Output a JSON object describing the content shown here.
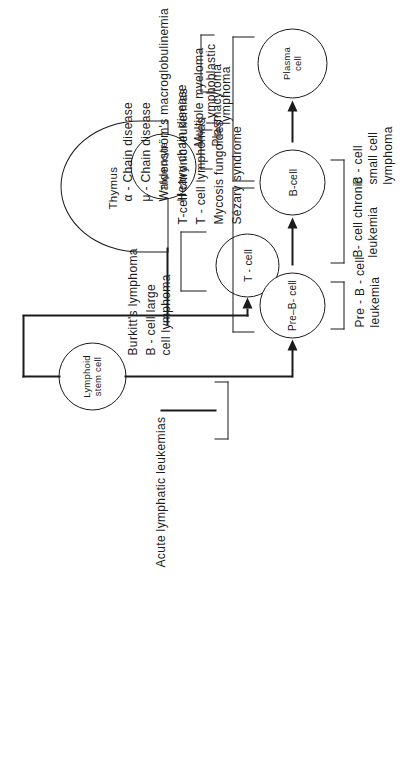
{
  "figure": {
    "orientation": "rotated-90-ccw",
    "line_color": "#1b1b1b",
    "background": "#ffffff"
  },
  "nodes": {
    "stem_cell": "Lymphoid\nstem cell",
    "t_cell": "T - cell",
    "pre_b_cell": "Pre–B- cell",
    "b_cell": "B-cell",
    "plasma_cell": "Plasma\ncell",
    "thymocyte": "Thymocyte",
    "thymus": "Thymus"
  },
  "labels": {
    "acute_lymphatic_leukemias": "Acute  lymphatic  leukemias",
    "lymphoblastic_lymphoma": "Lymphoblastic  lymphoma",
    "pre_b_cell_leukemia": "Pre - B - cell\nleukemia",
    "b_cell_chronic_leukemia": "B- cell chronic\nleukemia",
    "b_cell_small_cell_lymphoma": "B - cell\nsmall  cell\nlymphoma",
    "multiple_myeloma": "Multiple  myeloma",
    "plasmacytoma": "Plasmacytoma"
  },
  "t_cell_diseases": [
    "T-cell chronic leukemias",
    "T - cell lymphomas",
    "Mycosis  fungoides",
    "Sézary  syndrome"
  ],
  "b_cell_lymphomas": [
    "Burkitt's  lymphoma",
    "B - cell large\ncell  lymphoma"
  ],
  "plasma_cell_dyscrasias": [
    "α - Chain disease",
    "μ - Chain disease",
    "Waldenström's  macroglobulinemia",
    "Heavy  chain  disease"
  ]
}
